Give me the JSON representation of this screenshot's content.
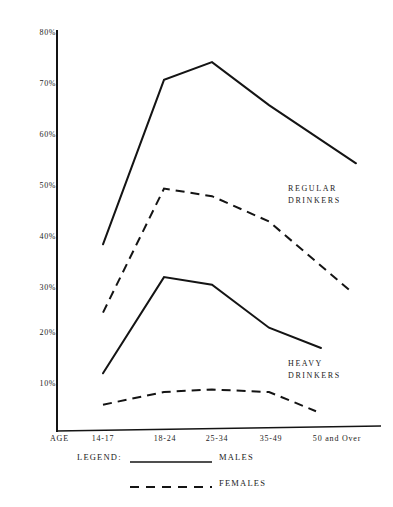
{
  "chart_data": {
    "type": "line",
    "title": "",
    "xlabel": "AGE",
    "ylabel": "",
    "categories": [
      "14-17",
      "18-24",
      "25-34",
      "35-49",
      "50 and Over"
    ],
    "ylim": [
      0,
      80
    ],
    "ytick_labels": [
      "80%",
      "70%",
      "60%",
      "50%",
      "40%",
      "30%",
      "20%",
      "10%"
    ],
    "yticks": [
      80,
      70,
      60,
      50,
      40,
      30,
      20,
      10
    ],
    "grid": false,
    "legend_position": "below-axis",
    "series": [
      {
        "name": "MALES",
        "group": "REGULAR DRINKERS",
        "style": "solid",
        "values": [
          37.5,
          70,
          73.5,
          65,
          53.5
        ]
      },
      {
        "name": "FEMALES",
        "group": "REGULAR DRINKERS",
        "style": "dashed",
        "values": [
          24,
          48.5,
          47,
          42,
          28
        ]
      },
      {
        "name": "MALES",
        "group": "HEAVY DRINKERS",
        "style": "solid",
        "values": [
          12,
          31,
          29.5,
          21,
          17
        ]
      },
      {
        "name": "FEMALES",
        "group": "HEAVY DRINKERS",
        "style": "dashed",
        "values": [
          5.8,
          8.3,
          8.8,
          8.3,
          4.5
        ]
      }
    ],
    "annotations": [
      {
        "id": "regular",
        "line1": "REGULAR",
        "line2": "DRINKERS"
      },
      {
        "id": "heavy",
        "line1": "HEAVY",
        "line2": "DRINKERS"
      }
    ]
  },
  "legend": {
    "title": "LEGEND:",
    "entries": [
      {
        "label": "MALES",
        "style": "solid"
      },
      {
        "label": "FEMALES",
        "style": "dashed"
      }
    ]
  },
  "axis": {
    "x_caption": "AGE",
    "x_labels": [
      "14-17",
      "18-24",
      "25-34",
      "35-49",
      "50 and Over"
    ],
    "y_labels": [
      "80%",
      "70%",
      "60%",
      "50%",
      "40%",
      "30%",
      "20%",
      "10%"
    ]
  },
  "colors": {
    "ink": "#141414",
    "paper": "#ffffff"
  }
}
